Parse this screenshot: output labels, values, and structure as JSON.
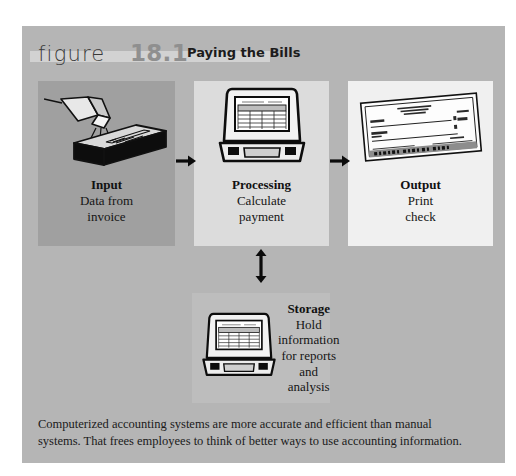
{
  "figure": {
    "label_word": "figure",
    "number": "18.1",
    "title": "Paying the Bills",
    "background_color": "#b5b5b5",
    "number_color": "#8f8f8f"
  },
  "panels": [
    {
      "id": "input",
      "icon": "barcode-scanner-icon",
      "heading": "Input",
      "line1": "Data from",
      "line2": "invoice",
      "panel_color": "#a0a0a0"
    },
    {
      "id": "processing",
      "icon": "desktop-computer-icon",
      "heading": "Processing",
      "line1": "Calculate",
      "line2": "payment",
      "panel_color": "#dcdcdc"
    },
    {
      "id": "output",
      "icon": "bank-check-icon",
      "heading": "Output",
      "line1": "Print",
      "line2": "check",
      "panel_color": "#f0f0f0"
    }
  ],
  "storage": {
    "id": "storage",
    "icon": "desktop-computer-icon",
    "heading": "Storage",
    "line1": "Hold",
    "line2": "information",
    "line3": "for reports",
    "line4": "and analysis",
    "panel_color": "#bdbdbd"
  },
  "arrows": [
    {
      "name": "arrow-input-to-processing",
      "direction": "right"
    },
    {
      "name": "arrow-processing-to-output",
      "direction": "right"
    },
    {
      "name": "arrow-processing-storage",
      "direction": "up-down"
    }
  ],
  "caption": {
    "line1": "Computerized accounting systems are more accurate and efficient than manual",
    "line2": "systems. That frees employees to think of better ways to use accounting information."
  }
}
